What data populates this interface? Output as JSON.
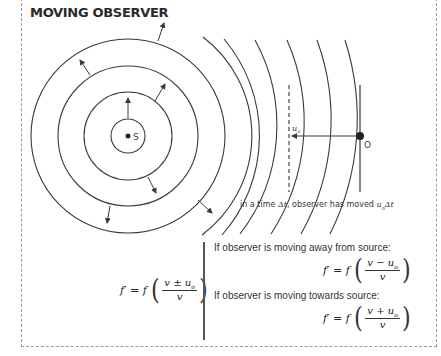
{
  "title": "MOVING OBSERVER",
  "diagram": {
    "source_label": "S",
    "observer_label": "O",
    "velocity_label": "u",
    "velocity_subscript": "o",
    "caption_prefix": "in a time ",
    "caption_delta_t": "Δt",
    "caption_mid": ", observer has moved ",
    "caption_u": "u",
    "caption_u_sub": "o",
    "caption_suffix": "Δt"
  },
  "equations": {
    "general": {
      "lhs": "f′ = f",
      "numerator": "v ± u",
      "num_sub": "o",
      "denominator": "v"
    },
    "away_label": "If observer is moving away from source:",
    "away": {
      "lhs": "f′ = f",
      "numerator": "v − u",
      "num_sub": "o",
      "denominator": "v"
    },
    "towards_label": "If observer is moving towards source:",
    "towards": {
      "lhs": "f′ = f",
      "numerator": "v + u",
      "num_sub": "o",
      "denominator": "v"
    }
  },
  "colors": {
    "line": "#3a3a3a",
    "border": "#9a9a9a",
    "text": "#2a2a2a"
  }
}
